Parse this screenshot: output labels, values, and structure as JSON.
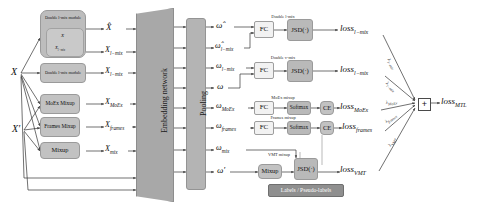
{
  "diagram": {
    "inputs": [
      {
        "label": "X"
      },
      {
        "label": "X′"
      }
    ],
    "modules": [
      {
        "name": "double-l-mix-module-top",
        "label": "Double l-mix module",
        "inner": [
          "X",
          "X_{l-mix}"
        ]
      },
      {
        "name": "double-l-mix-module-bottom",
        "label": "Double l-mix module"
      },
      {
        "name": "moex-mixup",
        "label": "MoEx Mixup"
      },
      {
        "name": "frames-mixup",
        "label": "Frames Mixup"
      },
      {
        "name": "mixup",
        "label": "Mixup"
      }
    ],
    "mixed_inputs": [
      {
        "base": "X",
        "sub": "",
        "hat": true
      },
      {
        "base": "X",
        "sub": "l−mix",
        "hat": false
      },
      {
        "base": "X",
        "sub": "l−mix",
        "hat": false
      },
      {
        "base": "X",
        "sub": "MoEx",
        "hat": false
      },
      {
        "base": "X",
        "sub": "frames",
        "hat": false
      },
      {
        "base": "X",
        "sub": "mix",
        "hat": false
      }
    ],
    "backbone": {
      "embedding_label": "Embedding network",
      "pooling_label": "Pooling"
    },
    "embeddings": [
      {
        "base": "ω",
        "sub": "",
        "hat": true
      },
      {
        "base": "ω",
        "sub": "l−mix",
        "hat": true
      },
      {
        "base": "ω",
        "sub": "l−mix",
        "hat": false
      },
      {
        "base": "ω",
        "sub": "",
        "hat": false
      },
      {
        "base": "ω",
        "sub": "MoEx",
        "hat": false
      },
      {
        "base": "ω",
        "sub": "frames",
        "hat": false
      },
      {
        "base": "ω",
        "sub": "mix",
        "hat": false
      },
      {
        "base": "ω′",
        "sub": "",
        "hat": false
      }
    ],
    "branch_captions": [
      {
        "label": "Double l-mix"
      },
      {
        "label": "Double v-mix"
      },
      {
        "label": "MoEx mixup"
      },
      {
        "label": "Frames mixup"
      },
      {
        "label": "VMT mixup"
      }
    ],
    "heads": {
      "fc_label": "FC",
      "jsd_label": "JSD(·)",
      "softmax_label": "Softmax",
      "ce_label": "CE",
      "mixup_label": "Mixup"
    },
    "labels_box": "Labels / Pseudo-labels",
    "losses": [
      {
        "base": "loss",
        "sub": "l−mix"
      },
      {
        "base": "loss",
        "sub": "l−mix"
      },
      {
        "base": "loss",
        "sub": "MoEx"
      },
      {
        "base": "loss",
        "sub": "frames"
      },
      {
        "base": "loss",
        "sub": "VMT"
      }
    ],
    "lambdas": [
      {
        "label": "λ",
        "sub": "l−mix"
      },
      {
        "label": "λ",
        "sub": "l−mix"
      },
      {
        "label": "λ",
        "sub": "MoEx"
      },
      {
        "label": "λ",
        "sub": "frames"
      },
      {
        "label": "λ",
        "sub": "VMT"
      }
    ],
    "sum_node": "+",
    "total_loss": {
      "base": "loss",
      "sub": "MTL"
    },
    "colors": {
      "module_grey": "#bdbdbd",
      "block_grey": "#b9b9b9",
      "light_block": "#f2f2f2",
      "dark_bar": "#8f8f8f",
      "backbone": "#a8a8a8",
      "wire": "#333333"
    }
  }
}
